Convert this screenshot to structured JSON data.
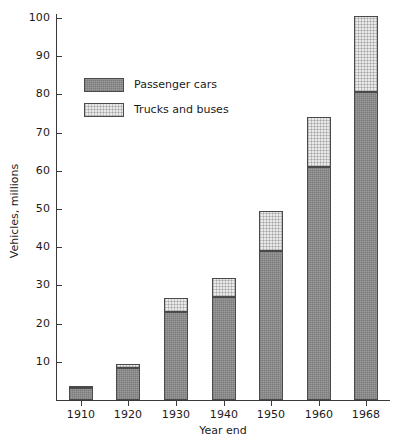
{
  "chart_data": {
    "type": "bar",
    "title": "",
    "subtitle": "",
    "xlabel": "Year end",
    "ylabel": "Vehicles, millions",
    "categories": [
      "1910",
      "1920",
      "1930",
      "1940",
      "1950",
      "1960",
      "1968"
    ],
    "series": [
      {
        "name": "Passenger cars",
        "values": [
          3.4,
          8.5,
          23.0,
          27.0,
          39.0,
          61.0,
          80.5
        ],
        "color": "#9a9a9a"
      },
      {
        "name": "Trucks and buses",
        "values": [
          0.2,
          1.0,
          3.7,
          5.0,
          10.5,
          13.0,
          20.0
        ],
        "color": "#e9e9e9"
      }
    ],
    "totals": [
      3.6,
      9.5,
      26.7,
      32.0,
      49.5,
      74.0,
      100.5
    ],
    "stacked": true,
    "ylim": [
      0,
      104
    ],
    "yticks": [
      10,
      20,
      30,
      40,
      50,
      60,
      70,
      80,
      90,
      100
    ],
    "ytick_labels": [
      "10",
      "20",
      "30",
      "40",
      "50",
      "60",
      "70",
      "80",
      "90",
      "100"
    ],
    "xtick_labels": [
      "1910",
      "1920",
      "1930",
      "1940",
      "1950",
      "1960",
      "1968"
    ],
    "grid": false,
    "legend_position": "upper-left-inset",
    "legend_entries": [
      "Passenger cars",
      "Trucks and buses"
    ]
  },
  "axes": {
    "y_title": "Vehicles, millions",
    "x_title": "Year end"
  },
  "legend": {
    "items": [
      {
        "label": "Passenger cars",
        "swatch": "cars-swatch"
      },
      {
        "label": "Trucks and buses",
        "swatch": "trucks-swatch"
      }
    ]
  }
}
